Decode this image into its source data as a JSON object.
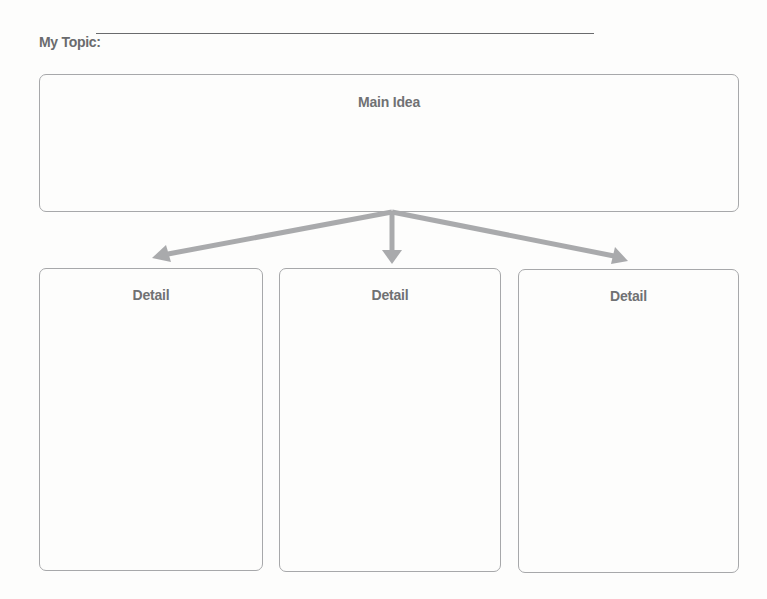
{
  "topic": {
    "label": "My Topic:",
    "value": ""
  },
  "main_idea": {
    "title": "Main Idea",
    "value": ""
  },
  "details": [
    {
      "title": "Detail",
      "value": ""
    },
    {
      "title": "Detail",
      "value": ""
    },
    {
      "title": "Detail",
      "value": ""
    }
  ],
  "colors": {
    "text": "#6d6e70",
    "box_border": "#a7a8aa",
    "arrow": "#a9aaac",
    "background": "#fdfdfc"
  }
}
